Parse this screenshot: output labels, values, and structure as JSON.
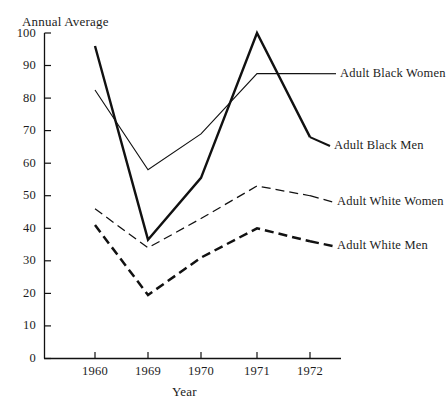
{
  "chart_data": {
    "type": "line",
    "title": "",
    "ylabel": "Annual Average",
    "xlabel": "Year",
    "categories": [
      "1960",
      "1969",
      "1970",
      "1971",
      "1972"
    ],
    "x": [
      1960,
      1969,
      1970,
      1971,
      1972
    ],
    "ylim": [
      0,
      100
    ],
    "yticks": [
      0,
      10,
      20,
      30,
      40,
      50,
      60,
      70,
      80,
      90,
      100
    ],
    "grid": false,
    "legend_position": "right-inline",
    "series": [
      {
        "name": "Adult Black Men",
        "style": "solid-thick",
        "values": [
          96,
          36.5,
          55.5,
          100,
          68
        ]
      },
      {
        "name": "Adult Black Women",
        "style": "solid-thin",
        "values": [
          82.5,
          58,
          69,
          87.5,
          87.5
        ]
      },
      {
        "name": "Adult White Women",
        "style": "dashed-thin",
        "values": [
          46,
          34,
          43,
          53,
          50
        ]
      },
      {
        "name": "Adult White Men",
        "style": "dashed-thick",
        "values": [
          41,
          19.5,
          31,
          40,
          36
        ]
      }
    ]
  },
  "axes": {
    "y_title": "Annual Average",
    "x_title": "Year",
    "y_tick_labels": [
      "100",
      "90",
      "80",
      "70",
      "60",
      "50",
      "40",
      "30",
      "20",
      "10",
      "0"
    ],
    "x_tick_labels": [
      "1960",
      "1969",
      "1970",
      "1971",
      "1972"
    ]
  },
  "legend": {
    "items": [
      {
        "label": "Adult Black Women"
      },
      {
        "label": "Adult Black Men"
      },
      {
        "label": "Adult White Women"
      },
      {
        "label": "Adult White Men"
      }
    ]
  },
  "colors": {
    "line": "#111111",
    "axis": "#111111",
    "background": "#ffffff",
    "text": "#1c1c1c"
  }
}
